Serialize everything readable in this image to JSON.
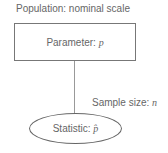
{
  "population_label": "Population: nominal scale",
  "parameter": {
    "label": "Parameter:",
    "symbol": "p"
  },
  "sample_label": {
    "label": "Sample size:",
    "symbol": "n"
  },
  "statistic": {
    "label": "Statistic:",
    "symbol": "p̂"
  }
}
